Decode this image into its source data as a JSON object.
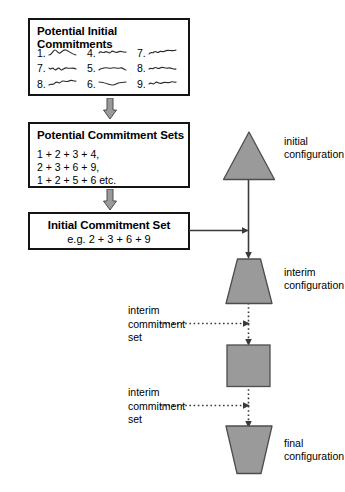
{
  "diagram": {
    "colors": {
      "shape_fill": "#9a9a9a",
      "shape_stroke": "#4d4d4d",
      "box_border": "#141414",
      "arrow_fill": "#9a9a9a",
      "arrow_stroke": "#4d4d4d",
      "line": "#3a3a3a",
      "background": "#ffffff"
    }
  },
  "boxes": {
    "initial_commitments": {
      "title": "Potential Initial Commitments",
      "items": [
        {
          "number": "1."
        },
        {
          "number": "4."
        },
        {
          "number": "7."
        },
        {
          "number": "2."
        },
        {
          "number": "5."
        },
        {
          "number": "8."
        },
        {
          "number": "3."
        },
        {
          "number": "6."
        },
        {
          "number": "9."
        }
      ]
    },
    "commitment_sets": {
      "title": "Potential Commitment Sets",
      "lines": [
        "1 + 2 + 3 + 4,",
        "2 + 3 + 6 + 9,",
        "1 + 2 + 5 + 6 etc."
      ]
    },
    "initial_set": {
      "title": "Initial Commitment Set",
      "example": "e.g. 2 + 3 + 6 + 9"
    }
  },
  "configurations": [
    {
      "shape": "triangle",
      "label_line1": "initial",
      "label_line2": "configuration"
    },
    {
      "shape": "trapezoid-up",
      "label_line1": "interim",
      "label_line2": "configuration"
    },
    {
      "shape": "square",
      "label_line1": "",
      "label_line2": ""
    },
    {
      "shape": "trapezoid-down",
      "label_line1": "final",
      "label_line2": "configuration"
    }
  ],
  "interim_labels": [
    {
      "line1": "interim",
      "line2": "commitment",
      "line3": "set"
    },
    {
      "line1": "interim",
      "line2": "commitment",
      "line3": "set"
    }
  ]
}
